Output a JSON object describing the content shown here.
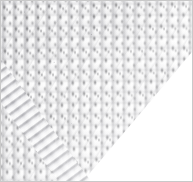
{
  "image": {
    "kind": "photograph",
    "subject": "knitted fabric swatch",
    "title": "Knitted fabric swatch corner",
    "width_px": 193,
    "height_px": 182,
    "alt_text": "Close-up photograph of a light grey knitted fabric swatch filling the upper-left triangle of the frame, its diagonal selvage edge running from the right side down to the bottom, against a plain white background."
  },
  "frame": {
    "border_color": "#c9c9c9",
    "border_width_px": 1,
    "background_color": "#ffffff"
  },
  "regions": [
    {
      "name": "fabric-swatch",
      "description": "Light grey knitted textile occupying the upper-left triangular area",
      "base_color": "#f3f3f3",
      "stitch_color": "#4a4a4e",
      "shadow_color": "#aaaab0"
    },
    {
      "name": "background-field",
      "description": "Empty white surface visible in the lower-right triangle",
      "color": "#ffffff"
    },
    {
      "name": "selvage-edge",
      "description": "Ribbed corded band running along the diagonal cut edge of the swatch",
      "color": "#e2e2e5"
    }
  ],
  "texture": {
    "pattern": "repeating diagonal knit stitches",
    "wale_spacing_px": 11,
    "course_spacing_px": 11,
    "diagonal_angle_deg": -58
  },
  "diagonal_edge": {
    "start_point": [
      175,
      45
    ],
    "end_point": [
      78,
      179
    ],
    "angle_deg": 53.5
  }
}
